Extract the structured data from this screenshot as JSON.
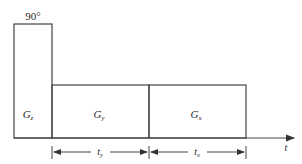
{
  "diagram": {
    "pulse_label": "90°",
    "blocks": [
      {
        "id": "gz",
        "main": "G",
        "sub": "z"
      },
      {
        "id": "gy",
        "main": "G",
        "sub": "y"
      },
      {
        "id": "gx",
        "main": "G",
        "sub": "x"
      }
    ],
    "intervals": [
      {
        "main": "t",
        "sub": "y"
      },
      {
        "main": "t",
        "sub": "x"
      }
    ],
    "axis_label": "t",
    "colors": {
      "line": "#444444",
      "text": "#2a2a2a"
    }
  }
}
